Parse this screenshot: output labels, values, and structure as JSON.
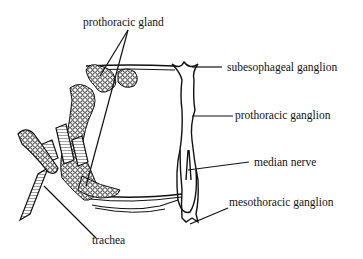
{
  "diagram": {
    "type": "anatomical illustration",
    "labels": {
      "prothoracic_gland": "prothoracic gland",
      "subesophageal_ganglion": "subesophageal ganglion",
      "prothoracic_ganglion": "prothoracic ganglion",
      "median_nerve": "median nerve",
      "mesothoracic_ganglion": "mesothoracic ganglion",
      "trachea": "trachea"
    },
    "colors": {
      "ink": "#111111",
      "background": "#ffffff"
    }
  }
}
